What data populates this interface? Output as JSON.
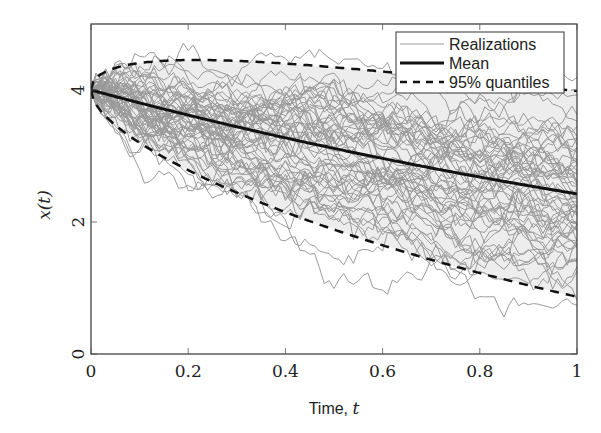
{
  "chart_data": {
    "type": "line",
    "title": "",
    "xlabel": "Time, t",
    "xlabel_text": "Time, ",
    "xlabel_var": "t",
    "ylabel": "x(t)",
    "ylabel_var": "x",
    "ylabel_arg": "t",
    "xlim": [
      0,
      1
    ],
    "ylim": [
      0,
      5
    ],
    "xticks": [
      0,
      0.2,
      0.4,
      0.6,
      0.8,
      1
    ],
    "xtick_labels": [
      "0",
      "0.2",
      "0.4",
      "0.6",
      "0.8",
      "1"
    ],
    "yticks": [
      0,
      2,
      4
    ],
    "ytick_labels": [
      "0",
      "2",
      "4"
    ],
    "grid": false,
    "legend_position": "upper right",
    "legend": [
      "Realizations",
      "Mean",
      "95% quantiles"
    ],
    "model": {
      "x0": 4,
      "theta": 0.5,
      "sigma": 1.0,
      "n_realizations": 60,
      "n_steps": 100
    },
    "series": [
      {
        "name": "Mean",
        "style": "solid-black",
        "x": [
          0,
          0.1,
          0.2,
          0.3,
          0.4,
          0.5,
          0.6,
          0.7,
          0.8,
          0.9,
          1.0
        ],
        "values": [
          4.0,
          3.8,
          3.62,
          3.44,
          3.27,
          3.12,
          2.96,
          2.82,
          2.68,
          2.55,
          2.43
        ]
      },
      {
        "name": "95% quantiles (upper)",
        "style": "dashed-black",
        "x": [
          0,
          0.1,
          0.2,
          0.3,
          0.4,
          0.5,
          0.6,
          0.7,
          0.8,
          0.9,
          1.0
        ],
        "values": [
          4.0,
          4.4,
          4.44,
          4.42,
          4.38,
          4.32,
          4.25,
          4.18,
          4.11,
          4.05,
          4.0
        ]
      },
      {
        "name": "95% quantiles (lower)",
        "style": "dashed-black",
        "x": [
          0,
          0.1,
          0.2,
          0.3,
          0.4,
          0.5,
          0.6,
          0.7,
          0.8,
          0.9,
          1.0
        ],
        "values": [
          4.0,
          3.21,
          2.8,
          2.47,
          2.17,
          1.91,
          1.68,
          1.46,
          1.25,
          1.05,
          0.85
        ]
      },
      {
        "name": "Realizations",
        "style": "thin-gray",
        "description": "60 stochastic sample paths starting at 4, spreading between roughly 0.4 and 4.5 by t=1"
      }
    ],
    "colors": {
      "realizations": "#9a9a9a",
      "mean": "#111111",
      "quantiles": "#111111",
      "band_fill": "#ededed",
      "axes": "#333333"
    }
  }
}
